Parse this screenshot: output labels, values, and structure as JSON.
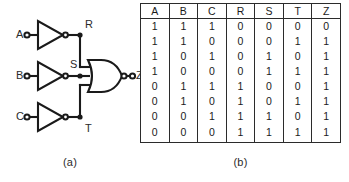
{
  "figure_a": {
    "caption": "(a)",
    "inputs": [
      {
        "label": "A",
        "terminal": "open-circle"
      },
      {
        "label": "B",
        "terminal": "open-circle"
      },
      {
        "label": "C",
        "terminal": "open-circle"
      }
    ],
    "gates": [
      {
        "name": "inverter-a",
        "type": "inverter",
        "input": "A",
        "output": "R"
      },
      {
        "name": "inverter-b",
        "type": "inverter",
        "input": "B",
        "output": "S"
      },
      {
        "name": "inverter-c",
        "type": "inverter",
        "input": "C",
        "output": "T"
      },
      {
        "name": "nor-gate",
        "type": "nor",
        "inputs": "R,S,T",
        "output": "Z"
      }
    ],
    "node_labels": {
      "r": "R",
      "s": "S",
      "t": "T"
    },
    "output": {
      "label": "Z",
      "terminal": "open-circle"
    },
    "colors": {
      "wire": "#1a1a1a",
      "fill": "#ffffff"
    }
  },
  "figure_b": {
    "caption": "(b)",
    "table": {
      "headers": [
        "A",
        "B",
        "C",
        "R",
        "S",
        "T",
        "Z"
      ],
      "rows": [
        [
          "1",
          "1",
          "1",
          "0",
          "0",
          "0",
          "0"
        ],
        [
          "1",
          "1",
          "0",
          "0",
          "0",
          "1",
          "1"
        ],
        [
          "1",
          "0",
          "1",
          "0",
          "1",
          "0",
          "1"
        ],
        [
          "1",
          "0",
          "0",
          "0",
          "1",
          "1",
          "1"
        ],
        [
          "0",
          "1",
          "1",
          "1",
          "0",
          "0",
          "1"
        ],
        [
          "0",
          "1",
          "0",
          "1",
          "0",
          "1",
          "1"
        ],
        [
          "0",
          "0",
          "1",
          "1",
          "1",
          "0",
          "1"
        ],
        [
          "0",
          "0",
          "0",
          "1",
          "1",
          "1",
          "1"
        ]
      ]
    }
  }
}
